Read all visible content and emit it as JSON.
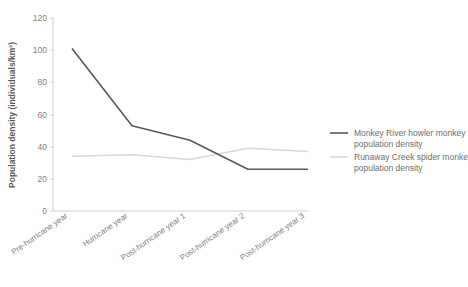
{
  "chart_data": {
    "type": "line",
    "title": "",
    "xlabel": "",
    "ylabel": "Population density (individuals/km²)",
    "categories": [
      "Pre-hurricane year",
      "Hurricane year",
      "Post-hurricane year 1",
      "Post-hurricane year 2",
      "Post-hurricane year 3"
    ],
    "yticks": [
      0,
      20,
      40,
      60,
      80,
      100,
      120
    ],
    "ylim": [
      0,
      120
    ],
    "grid": false,
    "legend_position": "right",
    "series": [
      {
        "name": "Monkey River howler monkey population density",
        "color": "#595959",
        "values": [
          101,
          53,
          44,
          26,
          26
        ]
      },
      {
        "name": "Runaway Creek spider monkey population density",
        "color": "#d9d9d9",
        "values": [
          34,
          35,
          32,
          39,
          37
        ]
      }
    ]
  },
  "legend": {
    "items": [
      {
        "label": "Monkey River howler monkey population density",
        "color": "#595959"
      },
      {
        "label": "Runaway Creek spider monkey population density",
        "color": "#d9d9d9"
      }
    ]
  },
  "colors": {
    "axis": "#d0d0d0",
    "tick_text": "#7f7f7f",
    "axis_title": "#595959",
    "background": "#ffffff",
    "series_dark": "#595959",
    "series_light": "#d9d9d9"
  }
}
